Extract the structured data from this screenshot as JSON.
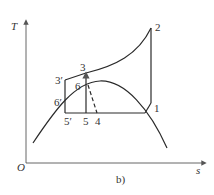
{
  "diagram": {
    "type": "T-s diagram",
    "axes": {
      "y_label": "T",
      "x_label": "s",
      "origin_label": "O"
    },
    "caption": "b)",
    "points": [
      {
        "id": "1",
        "label": "1"
      },
      {
        "id": "2",
        "label": "2"
      },
      {
        "id": "3",
        "label": "3"
      },
      {
        "id": "3p",
        "label": "3′"
      },
      {
        "id": "4",
        "label": "4"
      },
      {
        "id": "5",
        "label": "5"
      },
      {
        "id": "5p",
        "label": "5′"
      },
      {
        "id": "6",
        "label": "6"
      },
      {
        "id": "6p",
        "label": "6′"
      }
    ],
    "colors": {
      "line": "#2a2a2a",
      "axis": "#555555",
      "text": "#333333"
    }
  }
}
